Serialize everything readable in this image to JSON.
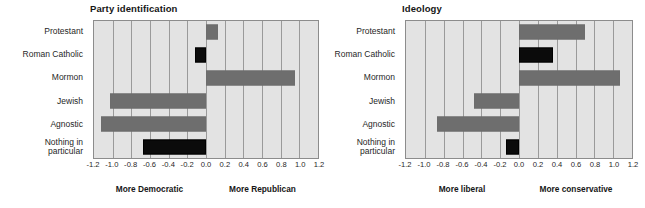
{
  "chart_data": [
    {
      "type": "bar",
      "title": "Party identification",
      "orientation": "horizontal",
      "xlabel": "",
      "ylabel": "",
      "xlim": [
        -1.2,
        1.2
      ],
      "grid": true,
      "legend": null,
      "categories": [
        "Protestant",
        "Roman Catholic",
        "Mormon",
        "Jewish",
        "Agnostic",
        "Nothing in particular"
      ],
      "category_lines": [
        [
          "Protestant"
        ],
        [
          "Roman Catholic"
        ],
        [
          "Mormon"
        ],
        [
          "Jewish"
        ],
        [
          "Agnostic"
        ],
        [
          "Nothing in",
          "particular"
        ]
      ],
      "values": [
        0.13,
        -0.12,
        0.95,
        -1.03,
        -1.13,
        -0.67
      ],
      "bar_colors": [
        "#6e6e6e",
        "#0b0b0b",
        "#6e6e6e",
        "#6e6e6e",
        "#6e6e6e",
        "#0b0b0b"
      ],
      "ticks": [
        "-1.2",
        "-1.0",
        "-0.8",
        "-0.6",
        "-0.4",
        "-0.2",
        "0.0",
        "0.2",
        "0.4",
        "0.6",
        "0.8",
        "1.0",
        "1.2"
      ],
      "tick_values": [
        -1.2,
        -1.0,
        -0.8,
        -0.6,
        -0.4,
        -0.2,
        0.0,
        0.2,
        0.4,
        0.6,
        0.8,
        1.0,
        1.2
      ],
      "axis_end_left": "More Democratic",
      "axis_end_right": "More Republican"
    },
    {
      "type": "bar",
      "title": "Ideology",
      "orientation": "horizontal",
      "xlabel": "",
      "ylabel": "",
      "xlim": [
        -1.2,
        1.2
      ],
      "grid": true,
      "legend": null,
      "categories": [
        "Protestant",
        "Roman Catholic",
        "Mormon",
        "Jewish",
        "Agnostic",
        "Nothing in particular"
      ],
      "category_lines": [
        [
          "Protestant"
        ],
        [
          "Roman Catholic"
        ],
        [
          "Mormon"
        ],
        [
          "Jewish"
        ],
        [
          "Agnostic"
        ],
        [
          "Nothing in",
          "particular"
        ]
      ],
      "values": [
        0.7,
        0.36,
        1.07,
        -0.48,
        -0.87,
        -0.14
      ],
      "bar_colors": [
        "#6e6e6e",
        "#0b0b0b",
        "#6e6e6e",
        "#6e6e6e",
        "#6e6e6e",
        "#0b0b0b"
      ],
      "ticks": [
        "-1.2",
        "-1.0",
        "-0.8",
        "-0.6",
        "-0.4",
        "-0.2",
        "0.0",
        "0.2",
        "0.4",
        "0.6",
        "0.8",
        "1.0",
        "1.2"
      ],
      "tick_values": [
        -1.2,
        -1.0,
        -0.8,
        -0.6,
        -0.4,
        -0.2,
        0.0,
        0.2,
        0.4,
        0.6,
        0.8,
        1.0,
        1.2
      ],
      "axis_end_left": "More liberal",
      "axis_end_right": "More  conservative"
    }
  ],
  "colors": {
    "bar_gray": "#6e6e6e",
    "bar_black": "#0b0b0b",
    "plot_background": "#e3e3e3",
    "gridline": "#9a9a9a",
    "axis": "#8c8c8c"
  }
}
